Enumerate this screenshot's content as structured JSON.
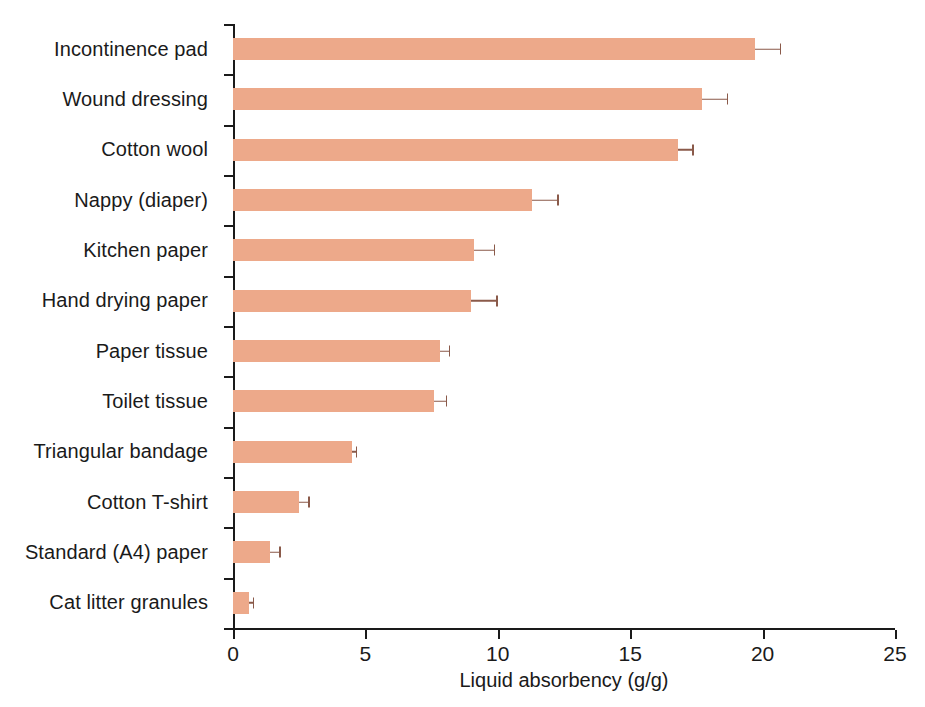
{
  "chart_data": {
    "type": "bar",
    "orientation": "horizontal",
    "title": "",
    "xlabel": "Liquid absorbency (g/g)",
    "ylabel": "",
    "xlim": [
      0,
      25
    ],
    "xticks": [
      0,
      5,
      10,
      15,
      20,
      25
    ],
    "xtick_labels": [
      "0",
      "5",
      "10",
      "15",
      "20",
      "25"
    ],
    "grid": false,
    "legend": null,
    "bar_color": "#eda98a",
    "error_color": "#8a5a4a",
    "axis_color": "#1a1a1a",
    "error_type": "error bars",
    "categories": [
      "Incontinence pad",
      "Wound dressing",
      "Cotton wool",
      "Nappy (diaper)",
      "Kitchen paper",
      "Hand drying paper",
      "Paper tissue",
      "Toilet tissue",
      "Triangular bandage",
      "Cotton T-shirt",
      "Standard (A4) paper",
      "Cat litter granules"
    ],
    "values": [
      19.7,
      17.7,
      16.8,
      11.3,
      9.1,
      9.0,
      7.8,
      7.6,
      4.5,
      2.5,
      1.4,
      0.6
    ],
    "errors": [
      1.0,
      1.0,
      0.6,
      1.0,
      0.8,
      1.0,
      0.4,
      0.5,
      0.2,
      0.4,
      0.4,
      0.2
    ]
  },
  "axis": {
    "x_title": "Liquid absorbency (g/g)"
  }
}
